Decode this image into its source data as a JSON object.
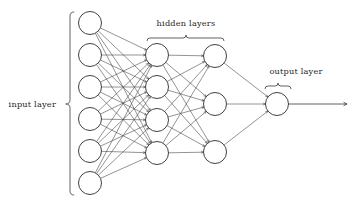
{
  "diagram": {
    "background_color": "#ffffff",
    "stroke_color": "#3a3a3a",
    "node_stroke_color": "#2b2b2b",
    "node_fill_color": "#ffffff",
    "text_color": "#1f1f1f",
    "labels": {
      "input_layer": "input layer",
      "hidden_layers": "hidden layers",
      "output_layer": "output layer"
    },
    "layers": [
      {
        "id": "input",
        "label": "input layer",
        "node_count": 6,
        "cx": 90,
        "radius": 11.5,
        "node_cy": [
          23,
          55,
          87,
          119,
          151,
          183
        ]
      },
      {
        "id": "hidden-1",
        "label": "hidden layer 1",
        "node_count": 4,
        "cx": 157,
        "radius": 11.5,
        "node_cy": [
          55,
          87,
          120,
          153
        ]
      },
      {
        "id": "hidden-2",
        "label": "hidden layer 2",
        "node_count": 3,
        "cx": 215,
        "radius": 11.5,
        "node_cy": [
          56,
          104,
          152
        ]
      },
      {
        "id": "output",
        "label": "output layer",
        "node_count": 1,
        "cx": 277,
        "radius": 11.5,
        "node_cy": [
          104
        ]
      }
    ],
    "connections": [
      {
        "from": "input",
        "to": "hidden-1",
        "type": "fully-connected",
        "edge_count": 24
      },
      {
        "from": "hidden-1",
        "to": "hidden-2",
        "type": "fully-connected",
        "edge_count": 12
      },
      {
        "from": "hidden-2",
        "to": "output",
        "type": "fully-connected",
        "edge_count": 3
      }
    ],
    "output_arrow": {
      "x1": 288,
      "x2": 347,
      "y": 104
    },
    "braces": {
      "input": {
        "orientation": "vertical-left",
        "x": 70,
        "y_top": 12,
        "y_bottom": 195,
        "tip_y": 104
      },
      "hidden": {
        "orientation": "horizontal-top",
        "x_left": 147,
        "x_right": 224,
        "y": 38,
        "tip_x": 186
      },
      "output": {
        "orientation": "horizontal-top",
        "x_left": 265,
        "x_right": 291,
        "y": 86,
        "tip_x": 278
      }
    },
    "label_positions": {
      "input_layer": {
        "x": 56,
        "y": 107,
        "anchor": "end"
      },
      "hidden_layers": {
        "x": 186,
        "y": 26,
        "anchor": "middle"
      },
      "output_layer": {
        "x": 296,
        "y": 74,
        "anchor": "middle"
      }
    }
  }
}
